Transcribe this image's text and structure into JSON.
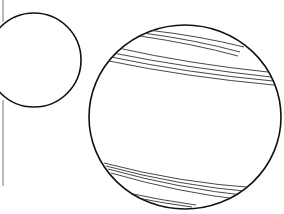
{
  "figure": {
    "colors": {
      "background": "#ffffff",
      "outline": "#111111",
      "band_line": "#333333",
      "margin_line": "#777777"
    },
    "margin_line": {
      "x": 3,
      "segments": [
        [
          0,
          22
        ],
        [
          100,
          186
        ]
      ]
    },
    "small_sphere": {
      "cx": 34,
      "cy": 60,
      "rx": 47,
      "ry": 47
    },
    "large_sphere": {
      "cx": 185,
      "cy": 117,
      "rx": 96,
      "ry": 92,
      "bands": [
        {
          "name": "top-cap-band",
          "lines": [
            "M148 30 Q200 36 244 47",
            "M143 33 Q196 40 240 52",
            "M140 36 Q194 44 238 56"
          ]
        },
        {
          "name": "upper-band",
          "lines": [
            "M118 48 Q190 64 268 72",
            "M113 53 Q188 68 271 77",
            "M111 57 Q187 73 273 81",
            "M109 61 Q186 77 274 85"
          ]
        },
        {
          "name": "lower-band",
          "lines": [
            "M104 163 Q180 183 258 188",
            "M106 166 Q180 186 254 192",
            "M108 169 Q180 189 251 196",
            "M111 173 Q180 193 245 200"
          ]
        },
        {
          "name": "bottom-cap-band",
          "lines": [
            "M128 193 Q160 200 196 205",
            "M132 197 Q162 203 192 207"
          ]
        }
      ]
    }
  }
}
